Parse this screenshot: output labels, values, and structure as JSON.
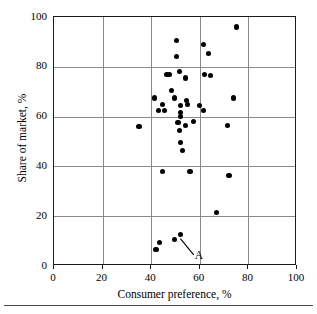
{
  "figure": {
    "background_color": "#ffffff",
    "frame_color": "#1a1a1a",
    "grid_color": "#8a8a8a",
    "point_color": "#000000"
  },
  "annotation": {
    "label": "A",
    "target_x": 52,
    "target_y": 11,
    "label_x": 57.5,
    "label_y": 4.5
  },
  "chart_data": {
    "type": "scatter",
    "title": "",
    "xlabel": "Consumer preference, %",
    "ylabel": "Share of market, %",
    "xlim": [
      0,
      100
    ],
    "ylim": [
      0,
      100
    ],
    "xticks": [
      0,
      20,
      40,
      60,
      80,
      100
    ],
    "yticks": [
      0,
      20,
      40,
      60,
      80,
      100
    ],
    "xtick_labels": [
      "0",
      "20",
      "40",
      "60",
      "80",
      "100"
    ],
    "ytick_labels": [
      "0",
      "20",
      "40",
      "60",
      "80",
      "100"
    ],
    "grid": true,
    "legend": "none",
    "marker": "filled-circle",
    "series": [
      {
        "name": "brands",
        "points": [
          [
            35.0,
            56.0
          ],
          [
            41.5,
            67.5
          ],
          [
            43.0,
            62.5
          ],
          [
            44.5,
            65.0
          ],
          [
            45.5,
            62.5
          ],
          [
            44.5,
            38.0
          ],
          [
            46.5,
            77.0
          ],
          [
            47.5,
            77.0
          ],
          [
            48.5,
            70.5
          ],
          [
            49.5,
            67.5
          ],
          [
            50.5,
            90.5
          ],
          [
            50.5,
            84.0
          ],
          [
            51.5,
            78.0
          ],
          [
            52.0,
            64.5
          ],
          [
            52.0,
            61.5
          ],
          [
            52.0,
            60.0
          ],
          [
            51.0,
            57.5
          ],
          [
            51.5,
            54.5
          ],
          [
            52.0,
            49.5
          ],
          [
            53.0,
            46.5
          ],
          [
            54.0,
            75.5
          ],
          [
            54.5,
            66.5
          ],
          [
            55.0,
            65.0
          ],
          [
            54.0,
            56.5
          ],
          [
            56.0,
            38.0
          ],
          [
            57.5,
            58.0
          ],
          [
            60.0,
            64.5
          ],
          [
            61.5,
            89.0
          ],
          [
            62.0,
            77.0
          ],
          [
            61.5,
            62.5
          ],
          [
            63.5,
            85.5
          ],
          [
            64.5,
            76.5
          ],
          [
            67.0,
            21.5
          ],
          [
            71.5,
            56.5
          ],
          [
            72.0,
            36.5
          ],
          [
            74.0,
            67.5
          ],
          [
            75.0,
            96.0
          ],
          [
            42.0,
            6.5
          ],
          [
            43.5,
            9.5
          ],
          [
            49.5,
            10.5
          ],
          [
            52.0,
            12.5
          ]
        ]
      }
    ],
    "annotations": [
      {
        "text": "A",
        "points_to": [
          52,
          11
        ]
      }
    ]
  }
}
